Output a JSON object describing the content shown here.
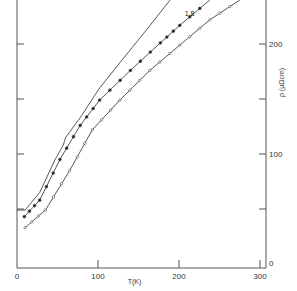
{
  "chart_data": {
    "type": "line",
    "title": "",
    "xlabel": "T(K)",
    "ylabel": "ρ (μΩcm)",
    "xlim": [
      0,
      300
    ],
    "ylim": [
      0,
      240
    ],
    "x_ticks": [
      0,
      100,
      200,
      300
    ],
    "x_tick_labels": [
      "0",
      "100",
      "200",
      "300"
    ],
    "y_ticks": [
      0,
      50,
      100,
      150,
      200
    ],
    "y_tick_labels": [
      "0",
      "",
      "100",
      "",
      "200"
    ],
    "y_axis_position": "right",
    "grid": false,
    "legend": null,
    "annotations": [
      {
        "text": "1.8",
        "x": 217,
        "y": 222
      }
    ],
    "series": [
      {
        "name": "curve-top",
        "marker": "none",
        "points": [
          [
            0,
            49
          ],
          [
            10,
            49
          ],
          [
            28,
            65
          ],
          [
            47,
            95
          ],
          [
            57,
            108
          ],
          [
            60,
            115
          ],
          [
            78,
            133
          ],
          [
            102,
            160
          ],
          [
            127,
            183
          ],
          [
            160,
            213
          ],
          [
            189,
            240
          ]
        ]
      },
      {
        "name": "curve-middle",
        "marker": "filled-circle",
        "points": [
          [
            9,
            43
          ],
          [
            28,
            58
          ],
          [
            53,
            95
          ],
          [
            78,
            126
          ],
          [
            102,
            149
          ],
          [
            140,
            176
          ],
          [
            177,
            201
          ],
          [
            201,
            217
          ],
          [
            238,
            240
          ]
        ]
      },
      {
        "name": "1.8",
        "marker": "open-circle",
        "points": [
          [
            10,
            33
          ],
          [
            35,
            49
          ],
          [
            65,
            85
          ],
          [
            93,
            122
          ],
          [
            127,
            149
          ],
          [
            164,
            176
          ],
          [
            201,
            199
          ],
          [
            238,
            222
          ],
          [
            275,
            240
          ]
        ]
      }
    ]
  },
  "axes": {
    "x_label": "T(K)",
    "y_label": "ρ (μΩcm)",
    "x_tick_labels": [
      "0",
      "100",
      "200",
      "300"
    ],
    "y_tick_labels": [
      "0",
      "100",
      "200"
    ],
    "curve_label": "1.8"
  }
}
